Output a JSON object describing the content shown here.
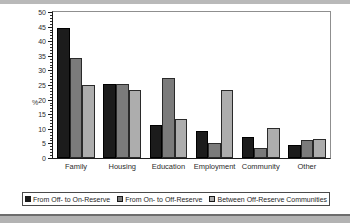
{
  "chart_data": {
    "type": "bar",
    "title": "",
    "subtitle": "",
    "xlabel": "",
    "ylabel": "%",
    "ylim": [
      0,
      50
    ],
    "ytick_step": 5,
    "yticks": [
      0,
      5,
      10,
      15,
      20,
      25,
      30,
      35,
      40,
      45,
      50
    ],
    "ytick_labels": [
      "0",
      "5",
      "10",
      "15",
      "20",
      "25",
      "30",
      "35",
      "40",
      "45",
      "50"
    ],
    "minor_tick_step": 1,
    "grid": false,
    "legend_position": "bottom",
    "categories": [
      "Family",
      "Housing",
      "Education",
      "Employment",
      "Community",
      "Other"
    ],
    "series": [
      {
        "name": "From Off- to On-Reserve",
        "color": "#1c1c1c",
        "values": [
          44.5,
          25.2,
          11.2,
          9.4,
          7.3,
          4.5
        ]
      },
      {
        "name": "From On- to Off-Reserve",
        "color": "#7b7b7b",
        "values": [
          34.4,
          25.2,
          27.3,
          5.3,
          3.3,
          6.3
        ]
      },
      {
        "name": "Between Off-Reserve Communities",
        "color": "#adadad",
        "values": [
          25.1,
          23.2,
          13.3,
          23.3,
          10.4,
          6.4
        ]
      }
    ]
  },
  "colors": {
    "series_dark": "#1c1c1c",
    "series_medium": "#7b7b7b",
    "series_light": "#adadad",
    "axis": "#1b1b1b",
    "background": "#ffffff"
  }
}
